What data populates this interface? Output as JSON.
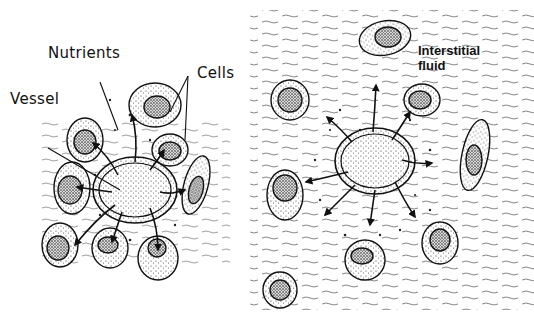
{
  "diagram": {
    "left_panel": {
      "labels": {
        "nutrients": "Nutrients",
        "cells": "Cells",
        "vessel": "Vessel"
      }
    },
    "right_panel": {
      "labels": {
        "interstitial_line1": "Interstitial",
        "interstitial_line2": "fluid"
      }
    },
    "colors": {
      "ink": "#111111",
      "background": "#ffffff"
    }
  }
}
